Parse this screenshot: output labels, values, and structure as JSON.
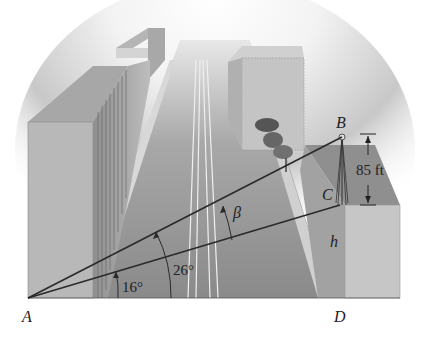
{
  "figure": {
    "type": "trigonometry-diagram",
    "points": {
      "A": "A",
      "B": "B",
      "C": "C",
      "D": "D"
    },
    "angles": {
      "lower": "16°",
      "upper": "26°",
      "difference": "β"
    },
    "measurements": {
      "BC_height": "85 ft",
      "CD_height": "h"
    },
    "colors": {
      "background": "#ffffff",
      "sky_glow": "#f4f4f4",
      "road": "#8e8e8e",
      "building_front": "#b9b9b9",
      "building_top": "#9c9c9c",
      "line": "#2a2a2a"
    }
  }
}
